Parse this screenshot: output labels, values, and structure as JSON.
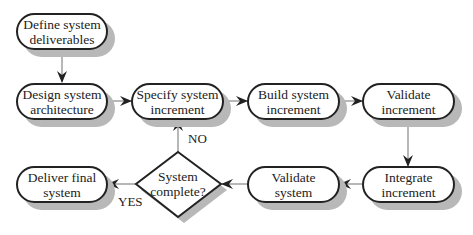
{
  "diagram": {
    "type": "flowchart",
    "nodes": [
      {
        "id": "n1",
        "label": "Define system deliverables",
        "line1": "Define system",
        "line2": "deliverables",
        "shape": "rounded"
      },
      {
        "id": "n2",
        "label": "Design system architecture",
        "line1": "Design system",
        "line2": "architecture",
        "shape": "rounded"
      },
      {
        "id": "n3",
        "label": "Specify system increment",
        "line1": "Specify system",
        "line2": "increment",
        "shape": "rounded"
      },
      {
        "id": "n4",
        "label": "Build system increment",
        "line1": "Build system",
        "line2": "increment",
        "shape": "rounded"
      },
      {
        "id": "n5",
        "label": "Validate increment",
        "line1": "Validate",
        "line2": "increment",
        "shape": "rounded"
      },
      {
        "id": "n6",
        "label": "Integrate increment",
        "line1": "Integrate",
        "line2": "increment",
        "shape": "rounded"
      },
      {
        "id": "n7",
        "label": "Validate system",
        "line1": "Validate",
        "line2": "system",
        "shape": "rounded"
      },
      {
        "id": "n8",
        "label": "System complete?",
        "line1": "System",
        "line2": "complete?",
        "shape": "diamond"
      },
      {
        "id": "n9",
        "label": "Deliver final system",
        "line1": "Deliver final",
        "line2": "system",
        "shape": "rounded"
      }
    ],
    "edges": [
      {
        "from": "n1",
        "to": "n2",
        "label": ""
      },
      {
        "from": "n2",
        "to": "n3",
        "label": ""
      },
      {
        "from": "n3",
        "to": "n4",
        "label": ""
      },
      {
        "from": "n4",
        "to": "n5",
        "label": ""
      },
      {
        "from": "n5",
        "to": "n6",
        "label": ""
      },
      {
        "from": "n6",
        "to": "n7",
        "label": ""
      },
      {
        "from": "n7",
        "to": "n8",
        "label": ""
      },
      {
        "from": "n8",
        "to": "n3",
        "label": "NO"
      },
      {
        "from": "n8",
        "to": "n9",
        "label": "YES"
      }
    ],
    "edge_labels": {
      "no": "NO",
      "yes": "YES"
    }
  }
}
